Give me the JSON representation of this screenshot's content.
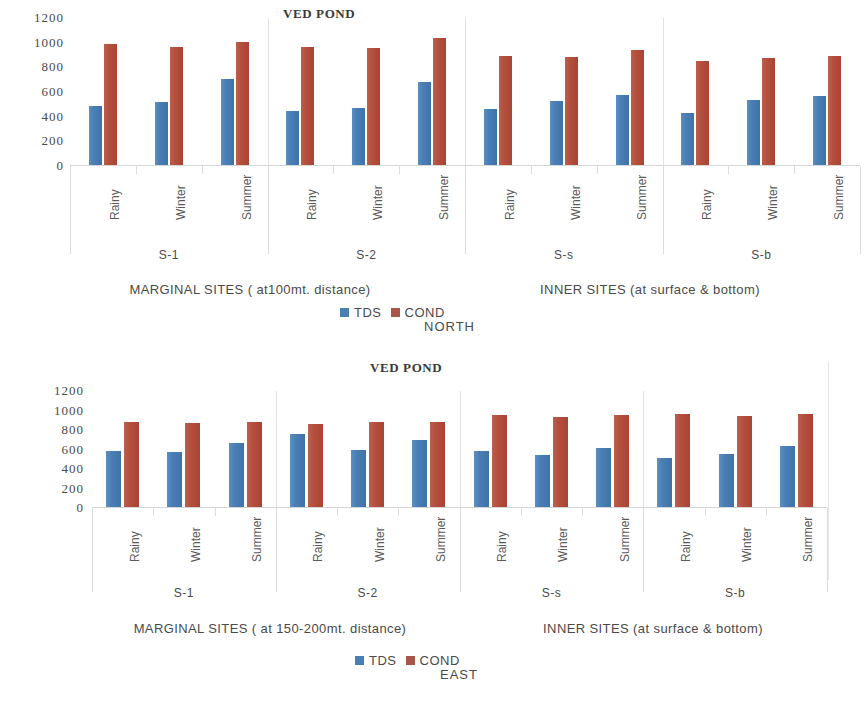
{
  "charts": [
    {
      "id": "north",
      "title": "VED POND",
      "region": "NORTH",
      "yticks": [
        1200,
        1000,
        800,
        600,
        400,
        200,
        0
      ],
      "ylim": [
        0,
        1200
      ],
      "seasons": [
        "Rainy",
        "Winter",
        "Summer"
      ],
      "groups": [
        "S-1",
        "S-2",
        "S-s",
        "S-b"
      ],
      "sections": [
        "MARGINAL SITES ( at100mt. distance)",
        "INNER  SITES (at surface & bottom)"
      ],
      "legend": [
        {
          "label": "TDS",
          "color": "#4a7fb5"
        },
        {
          "label": "COND",
          "color": "#a9564a"
        }
      ],
      "chart_data": {
        "type": "bar",
        "title": "VED POND",
        "subtitle": "NORTH",
        "xlabel": "",
        "ylabel": "",
        "ylim": [
          0,
          1200
        ],
        "yticks": [
          0,
          200,
          400,
          600,
          800,
          1000,
          1200
        ],
        "grid": false,
        "legend_position": "bottom",
        "categories": [
          "S-1 Rainy",
          "S-1 Winter",
          "S-1 Summer",
          "S-2 Rainy",
          "S-2 Winter",
          "S-2 Summer",
          "S-s Rainy",
          "S-s Winter",
          "S-s Summer",
          "S-b Rainy",
          "S-b Winter",
          "S-b Summer"
        ],
        "series": [
          {
            "name": "TDS",
            "color": "#4a7fb5",
            "values": [
              480,
              510,
              700,
              440,
              460,
              670,
              455,
              515,
              565,
              420,
              530,
              560
            ]
          },
          {
            "name": "COND",
            "color": "#a9564a",
            "values": [
              985,
              960,
              1000,
              960,
              950,
              1030,
              880,
              875,
              930,
              840,
              865,
              885
            ]
          }
        ]
      }
    },
    {
      "id": "east",
      "title": "VED POND",
      "region": "EAST",
      "yticks": [
        1200,
        1000,
        800,
        600,
        400,
        200,
        0
      ],
      "ylim": [
        0,
        1200
      ],
      "seasons": [
        "Rainy",
        "Winter",
        "Summer"
      ],
      "groups": [
        "S-1",
        "S-2",
        "S-s",
        "S-b"
      ],
      "sections": [
        "MARGINAL SITES ( at 150-200mt. distance)",
        "INNER  SITES (at surface & bottom)"
      ],
      "legend": [
        {
          "label": "TDS",
          "color": "#4a7fb5"
        },
        {
          "label": "COND",
          "color": "#a9564a"
        }
      ],
      "chart_data": {
        "type": "bar",
        "title": "VED POND",
        "subtitle": "EAST",
        "xlabel": "",
        "ylabel": "",
        "ylim": [
          0,
          1200
        ],
        "yticks": [
          0,
          200,
          400,
          600,
          800,
          1000,
          1200
        ],
        "grid": false,
        "legend_position": "bottom",
        "categories": [
          "S-1 Rainy",
          "S-1 Winter",
          "S-1 Summer",
          "S-2 Rainy",
          "S-2 Winter",
          "S-2 Summer",
          "S-s Rainy",
          "S-s Winter",
          "S-s Summer",
          "S-b Rainy",
          "S-b Winter",
          "S-b Summer"
        ],
        "series": [
          {
            "name": "TDS",
            "color": "#4a7fb5",
            "values": [
              570,
              560,
              660,
              750,
              580,
              690,
              575,
              530,
              610,
              500,
              545,
              625
            ]
          },
          {
            "name": "COND",
            "color": "#a9564a",
            "values": [
              870,
              865,
              870,
              855,
              870,
              875,
              940,
              925,
              945,
              950,
              935,
              950
            ]
          }
        ]
      }
    }
  ]
}
